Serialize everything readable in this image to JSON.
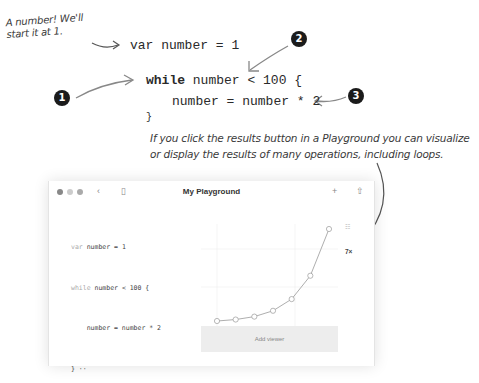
{
  "annotations": {
    "note_start": "A number! We'll start it at 1.",
    "caption": "If you click the results button in a Playground you can visualize or display the results of many operations, including loops.",
    "badges": [
      "1",
      "2",
      "3"
    ]
  },
  "big_code": {
    "line1": "var number = 1",
    "line2_kw": "while",
    "line2_rest": " number < 100 {",
    "line3": "number = number * 2",
    "line4": "}"
  },
  "window": {
    "title": "My Playground",
    "toolbar": {
      "back_icon": "‹",
      "sidebar_icon": "▯",
      "add_icon": "+",
      "share_icon": "⇧"
    },
    "editor_lines": [
      {
        "kw": "var",
        "rest": " number = 1"
      },
      {
        "kw": "while",
        "rest": " number < 100 {"
      },
      {
        "kw": "",
        "rest": "    number = number * 2"
      },
      {
        "kw": "",
        "rest": "} ··"
      }
    ],
    "results": {
      "viewer_icon": "☷",
      "count": "7×"
    },
    "add_viewer_label": "Add viewer"
  },
  "chart_data": {
    "type": "line",
    "title": "",
    "xlabel": "",
    "ylabel": "",
    "x": [
      1,
      2,
      3,
      4,
      5,
      6,
      7
    ],
    "values": [
      2,
      4,
      8,
      16,
      32,
      64,
      128
    ],
    "grid": true
  }
}
